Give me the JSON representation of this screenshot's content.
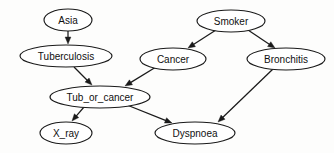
{
  "diagram": {
    "type": "directed-acyclic-graph",
    "background_color": "#fdfdfc",
    "node_fill": "#ffffff",
    "stroke_color": "#1a1a1a",
    "nodes": [
      {
        "id": "asia",
        "label": "Asia",
        "cx": 68,
        "cy": 20,
        "rx": 24,
        "ry": 11,
        "font_size": 10
      },
      {
        "id": "tuberculosis",
        "label": "Tuberculosis",
        "cx": 66,
        "cy": 56,
        "rx": 46,
        "ry": 11,
        "font_size": 10
      },
      {
        "id": "smoker",
        "label": "Smoker",
        "cx": 231,
        "cy": 21,
        "rx": 34,
        "ry": 11,
        "font_size": 10
      },
      {
        "id": "cancer",
        "label": "Cancer",
        "cx": 173,
        "cy": 59,
        "rx": 33,
        "ry": 11,
        "font_size": 10
      },
      {
        "id": "bronchitis",
        "label": "Bronchitis",
        "cx": 286,
        "cy": 59,
        "rx": 39,
        "ry": 11,
        "font_size": 10
      },
      {
        "id": "tub_or_cancer",
        "label": "Tub_or_cancer",
        "cx": 100,
        "cy": 97,
        "rx": 50,
        "ry": 11,
        "font_size": 10
      },
      {
        "id": "x_ray",
        "label": "X_ray",
        "cx": 66,
        "cy": 133,
        "rx": 26,
        "ry": 11,
        "font_size": 10
      },
      {
        "id": "dyspnoea",
        "label": "Dyspnoea",
        "cx": 195,
        "cy": 133,
        "rx": 40,
        "ry": 11,
        "font_size": 10
      }
    ],
    "edges": [
      {
        "id": "asia-tuberculosis",
        "from": "asia",
        "to": "tuberculosis",
        "x1": 68,
        "y1": 31,
        "x2": 68,
        "y2": 44
      },
      {
        "id": "tuberculosis-tub_or_cancer",
        "from": "tuberculosis",
        "to": "tub_or_cancer",
        "x1": 74,
        "y1": 67,
        "x2": 92,
        "y2": 85
      },
      {
        "id": "smoker-cancer",
        "from": "smoker",
        "to": "cancer",
        "x1": 216,
        "y1": 30,
        "x2": 188,
        "y2": 48
      },
      {
        "id": "smoker-bronchitis",
        "from": "smoker",
        "to": "bronchitis",
        "x1": 248,
        "y1": 30,
        "x2": 275,
        "y2": 48
      },
      {
        "id": "cancer-tub_or_cancer",
        "from": "cancer",
        "to": "tub_or_cancer",
        "x1": 156,
        "y1": 67,
        "x2": 125,
        "y2": 86
      },
      {
        "id": "tub_or_cancer-x_ray",
        "from": "tub_or_cancer",
        "to": "x_ray",
        "x1": 84,
        "y1": 107,
        "x2": 72,
        "y2": 121
      },
      {
        "id": "tub_or_cancer-dyspnoea",
        "from": "tub_or_cancer",
        "to": "dyspnoea",
        "x1": 127,
        "y1": 105,
        "x2": 172,
        "y2": 123
      },
      {
        "id": "bronchitis-dyspnoea",
        "from": "bronchitis",
        "to": "dyspnoea",
        "x1": 273,
        "y1": 69,
        "x2": 218,
        "y2": 122
      }
    ]
  }
}
